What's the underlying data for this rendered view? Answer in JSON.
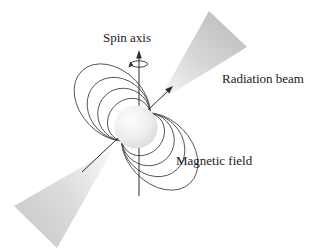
{
  "figure": {
    "type": "pulsar-neutron-star-diagram",
    "labels": {
      "spin_axis": "Spin axis",
      "radiation_beam": "Radiation beam",
      "magnetic_field": "Magnetic field"
    },
    "colors": {
      "background": "#ffffff",
      "beam_cone_near_apex": "#fbfbfb",
      "beam_cone_far_upper": "#c3c3c3",
      "beam_cone_far_lower": "#cfcfcf",
      "star_highlight": "#fdfdfd",
      "star_mid": "#ececec",
      "star_edge": "#cfcfcf",
      "field_line_stroke": "#4d4d4d",
      "axis_stroke": "#2b2b2b",
      "text": "#1a1a1a"
    }
  }
}
